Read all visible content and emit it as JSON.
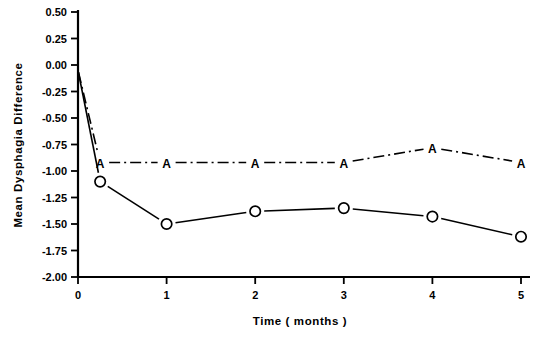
{
  "chart_data": {
    "type": "line",
    "title": "",
    "xlabel": "Time ( months )",
    "ylabel": "Mean  Dysphagia   Difference",
    "xlim": [
      -0.15,
      5.3
    ],
    "ylim": [
      -2.0,
      0.5
    ],
    "grid": false,
    "legend": "none",
    "x_ticks": [
      "0",
      "1",
      "2",
      "3",
      "4",
      "5"
    ],
    "x_tick_values": [
      0,
      1,
      2,
      3,
      4,
      5
    ],
    "y_ticks": [
      "0.50",
      "0.25",
      "0.00",
      "-0.25",
      "-0.50",
      "-0.75",
      "-1.00",
      "-1.25",
      "-1.50",
      "-1.75",
      "-2.00"
    ],
    "y_tick_values": [
      0.5,
      0.25,
      0.0,
      -0.25,
      -0.5,
      -0.75,
      -1.0,
      -1.25,
      -1.5,
      -1.75,
      -2.0
    ],
    "series": [
      {
        "name": "A",
        "marker": "A",
        "linestyle": "dash-dot",
        "color": "#000000",
        "x": [
          0.0,
          0.25,
          1.0,
          2.0,
          3.0,
          4.0,
          5.0
        ],
        "values": [
          -0.05,
          -0.92,
          -0.92,
          -0.92,
          -0.92,
          -0.78,
          -0.92
        ]
      },
      {
        "name": "O",
        "marker": "O",
        "linestyle": "solid",
        "color": "#000000",
        "x": [
          0.0,
          0.25,
          1.0,
          2.0,
          3.0,
          4.0,
          5.0
        ],
        "values": [
          -0.05,
          -1.1,
          -1.5,
          -1.38,
          -1.35,
          -1.43,
          -1.62
        ]
      }
    ]
  }
}
